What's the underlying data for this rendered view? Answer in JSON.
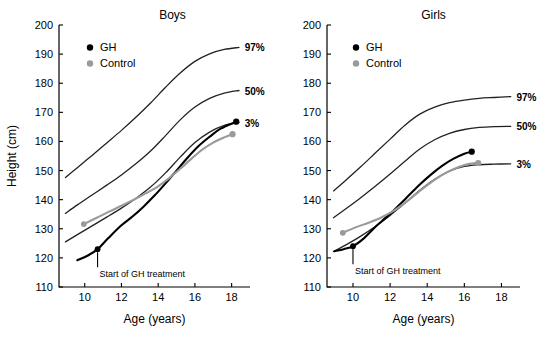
{
  "figure": {
    "title": "",
    "colors": {
      "gh": "#000000",
      "control": "#9a9a9a",
      "percentile": "#222222",
      "axis": "#000000",
      "background": "#ffffff"
    }
  },
  "chart_data": [
    {
      "type": "line",
      "title": "Boys",
      "xlabel": "Age (years)",
      "ylabel": "Height (cm)",
      "xlim": [
        8.6,
        19.0
      ],
      "ylim": [
        110,
        200
      ],
      "xticks": [
        10,
        12,
        14,
        16,
        18
      ],
      "xtick_labels": [
        "10",
        "12",
        "14",
        "16",
        "18"
      ],
      "yticks": [
        110,
        120,
        130,
        140,
        150,
        160,
        170,
        180,
        190,
        200
      ],
      "ytick_labels": [
        "110",
        "120",
        "130",
        "140",
        "150",
        "160",
        "170",
        "180",
        "190",
        "200"
      ],
      "grid": false,
      "legend": {
        "position": "upper-left",
        "entries": [
          {
            "label": "GH",
            "color": "#000000",
            "marker": "circle"
          },
          {
            "label": "Control",
            "color": "#9a9a9a",
            "marker": "circle"
          }
        ]
      },
      "annotations": [
        {
          "text": "Start of GH treatment",
          "x": 10.7,
          "y": 123.0,
          "marker": true
        }
      ],
      "series": [
        {
          "name": "97%",
          "kind": "percentile",
          "color": "#222222",
          "label": "97%",
          "label_x": 18.55,
          "label_y": 192.3,
          "x": [
            8.95,
            9.6,
            10.4,
            11.2,
            12.0,
            12.8,
            13.6,
            14.4,
            15.2,
            16.0,
            16.8,
            17.6,
            18.4
          ],
          "y": [
            147.6,
            151.0,
            155.2,
            159.5,
            163.8,
            168.4,
            173.3,
            178.6,
            183.5,
            187.5,
            190.1,
            191.6,
            192.3
          ]
        },
        {
          "name": "50%",
          "kind": "percentile",
          "color": "#222222",
          "label": "50%",
          "label_x": 18.55,
          "label_y": 177.5,
          "x": [
            8.95,
            9.6,
            10.4,
            11.2,
            12.0,
            12.8,
            13.6,
            14.4,
            15.2,
            16.0,
            16.8,
            17.6,
            18.4
          ],
          "y": [
            135.3,
            138.2,
            141.6,
            145.0,
            148.5,
            152.4,
            156.8,
            162.0,
            167.4,
            171.8,
            174.8,
            176.6,
            177.5
          ]
        },
        {
          "name": "3%",
          "kind": "percentile",
          "color": "#222222",
          "label": "3%",
          "label_x": 18.55,
          "label_y": 166.5,
          "x": [
            8.95,
            9.6,
            10.4,
            11.2,
            12.0,
            12.8,
            13.6,
            14.4,
            15.2,
            16.0,
            16.8,
            17.6,
            18.4
          ],
          "y": [
            125.5,
            128.0,
            131.0,
            134.0,
            137.1,
            140.5,
            144.4,
            149.2,
            154.6,
            159.6,
            163.2,
            165.5,
            166.5
          ]
        },
        {
          "name": "GH",
          "kind": "data",
          "color": "#000000",
          "start_marker": {
            "x": 10.7,
            "y": 123.0
          },
          "end_marker": {
            "x": 18.25,
            "y": 166.8
          },
          "x": [
            9.6,
            10.2,
            10.7,
            11.3,
            12.0,
            12.6,
            13.2,
            13.8,
            14.4,
            15.0,
            15.6,
            16.2,
            16.8,
            17.4,
            18.25
          ],
          "y": [
            119.2,
            120.9,
            123.0,
            126.9,
            131.2,
            134.2,
            137.6,
            141.4,
            145.6,
            150.0,
            154.4,
            158.4,
            161.6,
            164.4,
            166.8
          ]
        },
        {
          "name": "Control",
          "kind": "data",
          "color": "#9a9a9a",
          "start_marker": {
            "x": 9.95,
            "y": 131.6
          },
          "end_marker": {
            "x": 18.05,
            "y": 162.5
          },
          "x": [
            9.95,
            10.6,
            11.3,
            12.0,
            12.7,
            13.4,
            14.0,
            14.6,
            15.2,
            15.8,
            16.4,
            17.0,
            17.6,
            18.05
          ],
          "y": [
            131.6,
            133.6,
            135.8,
            137.9,
            140.1,
            142.4,
            144.6,
            147.4,
            150.6,
            154.0,
            157.2,
            159.6,
            161.4,
            162.5
          ]
        }
      ]
    },
    {
      "type": "line",
      "title": "Girls",
      "xlabel": "Age (years)",
      "ylabel": "",
      "xlim": [
        8.6,
        19.0
      ],
      "ylim": [
        110,
        200
      ],
      "xticks": [
        10,
        12,
        14,
        16,
        18
      ],
      "xtick_labels": [
        "10",
        "12",
        "14",
        "16",
        "18"
      ],
      "yticks": [
        110,
        120,
        130,
        140,
        150,
        160,
        170,
        180,
        190,
        200
      ],
      "ytick_labels": [
        "110",
        "120",
        "130",
        "140",
        "150",
        "160",
        "170",
        "180",
        "190",
        "200"
      ],
      "grid": false,
      "legend": {
        "position": "upper-left",
        "entries": [
          {
            "label": "GH",
            "color": "#000000",
            "marker": "circle"
          },
          {
            "label": "Control",
            "color": "#9a9a9a",
            "marker": "circle"
          }
        ]
      },
      "annotations": [
        {
          "text": "Start of GH treatment",
          "x": 10.0,
          "y": 124.0,
          "marker": true
        }
      ],
      "series": [
        {
          "name": "97%",
          "kind": "percentile",
          "color": "#222222",
          "label": "97%",
          "label_x": 18.65,
          "label_y": 175.4,
          "x": [
            8.95,
            9.6,
            10.4,
            11.2,
            12.0,
            12.8,
            13.6,
            14.4,
            15.2,
            16.0,
            16.8,
            17.6,
            18.5
          ],
          "y": [
            143.0,
            146.6,
            151.2,
            156.0,
            160.8,
            165.6,
            169.4,
            171.8,
            173.3,
            174.2,
            174.8,
            175.1,
            175.4
          ]
        },
        {
          "name": "50%",
          "kind": "percentile",
          "color": "#222222",
          "label": "50%",
          "label_x": 18.65,
          "label_y": 165.2,
          "x": [
            8.95,
            9.6,
            10.4,
            11.2,
            12.0,
            12.8,
            13.6,
            14.4,
            15.2,
            16.0,
            16.8,
            17.6,
            18.5
          ],
          "y": [
            133.8,
            136.8,
            140.6,
            144.6,
            148.8,
            153.2,
            157.4,
            160.6,
            162.8,
            164.1,
            164.8,
            165.1,
            165.2
          ]
        },
        {
          "name": "3%",
          "kind": "percentile",
          "color": "#222222",
          "label": "3%",
          "label_x": 18.65,
          "label_y": 152.3,
          "x": [
            8.95,
            9.6,
            10.4,
            11.2,
            12.0,
            12.8,
            13.6,
            14.4,
            15.2,
            16.0,
            16.8,
            17.6,
            18.5
          ],
          "y": [
            122.2,
            124.4,
            127.4,
            130.8,
            134.6,
            138.8,
            143.2,
            147.0,
            149.8,
            151.4,
            152.0,
            152.2,
            152.3
          ]
        },
        {
          "name": "GH",
          "kind": "data",
          "color": "#000000",
          "start_marker": {
            "x": 10.0,
            "y": 124.0
          },
          "end_marker": {
            "x": 16.4,
            "y": 156.5
          },
          "x": [
            9.0,
            9.5,
            10.0,
            10.6,
            11.2,
            11.8,
            12.4,
            13.0,
            13.6,
            14.2,
            14.8,
            15.4,
            16.0,
            16.4
          ],
          "y": [
            122.3,
            123.0,
            124.0,
            126.8,
            130.6,
            134.0,
            137.6,
            141.4,
            145.2,
            148.6,
            151.6,
            154.0,
            155.8,
            156.5
          ]
        },
        {
          "name": "Control",
          "kind": "data",
          "color": "#9a9a9a",
          "start_marker": {
            "x": 9.45,
            "y": 128.6
          },
          "end_marker": {
            "x": 16.75,
            "y": 152.6
          },
          "x": [
            9.45,
            10.1,
            10.8,
            11.5,
            12.2,
            12.9,
            13.6,
            14.3,
            15.0,
            15.7,
            16.2,
            16.75
          ],
          "y": [
            128.6,
            130.4,
            132.0,
            133.8,
            136.2,
            139.4,
            143.0,
            146.4,
            149.2,
            151.2,
            152.2,
            152.6
          ]
        }
      ]
    }
  ]
}
